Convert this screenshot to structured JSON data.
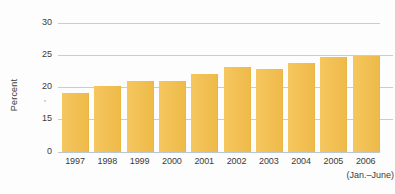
{
  "chart_data": {
    "type": "bar",
    "title": "",
    "subtitle": "",
    "xlabel": "",
    "ylabel": "Percent",
    "categories": [
      "1997",
      "1998",
      "1999",
      "2000",
      "2001",
      "2002",
      "2003",
      "2004",
      "2005",
      "2006"
    ],
    "values": [
      19.0,
      20.2,
      20.9,
      21.0,
      22.1,
      23.1,
      22.8,
      23.7,
      24.7,
      24.8
    ],
    "series": [
      {
        "name": "Percent",
        "values": [
          19.0,
          20.2,
          20.9,
          21.0,
          22.1,
          23.1,
          22.8,
          23.7,
          24.7,
          24.8
        ]
      }
    ],
    "ylim": [
      0,
      30
    ],
    "y_ticks": [
      0,
      15,
      20,
      25,
      30
    ],
    "y_tick_labels": [
      "0",
      "15",
      "20",
      "25",
      "30"
    ],
    "axis_break": true,
    "axis_break_between": [
      0,
      15
    ],
    "grid": true,
    "grid_axis": "y",
    "legend": false,
    "legend_position": "none",
    "annotations": [
      "(Jan.–June)"
    ],
    "bar_color": "#f3c257",
    "gridline_color": "#c2cfdb",
    "background_color": "#fdfdfd",
    "text_color": "#3b3b3b"
  },
  "axis": {
    "y_title": "Percent"
  },
  "x_axis": {
    "sublabel": "(Jan.–June)"
  }
}
